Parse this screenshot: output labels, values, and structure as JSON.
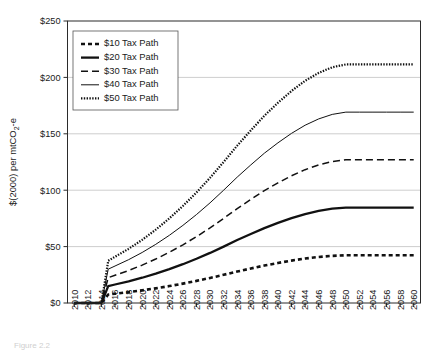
{
  "chart_data": {
    "type": "line",
    "title": "",
    "xlabel": "",
    "ylabel": "$(2000) per mtCO",
    "ylabel_sub": "2",
    "ylabel_tail": "-e",
    "ylabel_full": "$(2000) per mtCO2-e",
    "grid": true,
    "legend_position": "top-left-inside",
    "xlim": [
      2009,
      2061
    ],
    "ylim": [
      0,
      250
    ],
    "ytick_labels": [
      "$0",
      "$50",
      "$100",
      "$150",
      "$200",
      "$250"
    ],
    "ytick_values": [
      0,
      50,
      100,
      150,
      200,
      250
    ],
    "xtick_labels": [
      "2010",
      "2012",
      "2014",
      "2016",
      "2018",
      "2020",
      "2022",
      "2024",
      "2026",
      "2028",
      "2030",
      "2032",
      "2034",
      "2036",
      "2038",
      "2040",
      "2042",
      "2044",
      "2046",
      "2048",
      "2050",
      "2052",
      "2054",
      "2056",
      "2058",
      "2060"
    ],
    "x": [
      2010,
      2011,
      2012,
      2013,
      2014,
      2015,
      2016,
      2018,
      2020,
      2022,
      2024,
      2026,
      2028,
      2030,
      2032,
      2034,
      2036,
      2038,
      2040,
      2042,
      2044,
      2046,
      2048,
      2050,
      2052,
      2054,
      2056,
      2058,
      2060
    ],
    "series": [
      {
        "name": "$10 Tax Path",
        "dash": "4,3",
        "width": 2.6,
        "values": [
          0,
          0,
          0,
          0,
          0,
          7.5,
          8.2,
          9.6,
          11.2,
          13.0,
          15.0,
          17.2,
          19.6,
          22.2,
          25.0,
          27.9,
          30.6,
          33.2,
          35.5,
          37.6,
          39.4,
          40.8,
          41.8,
          42.3,
          42.3,
          42.3,
          42.3,
          42.3,
          42.3
        ]
      },
      {
        "name": "$20 Tax Path",
        "dash": "none",
        "width": 2.3,
        "values": [
          0,
          0,
          0,
          0,
          0,
          15.0,
          16.4,
          19.2,
          22.4,
          26.0,
          30.0,
          34.4,
          39.2,
          44.4,
          50.0,
          55.8,
          61.2,
          66.4,
          71.0,
          75.2,
          78.8,
          81.6,
          83.6,
          84.6,
          84.6,
          84.6,
          84.6,
          84.6,
          84.6
        ]
      },
      {
        "name": "$30 Tax Path",
        "dash": "7,4",
        "width": 1.5,
        "values": [
          0,
          0,
          0,
          0,
          0,
          22.5,
          24.6,
          28.8,
          33.6,
          39.0,
          45.0,
          51.6,
          58.8,
          66.6,
          75.0,
          83.7,
          91.8,
          99.6,
          106.5,
          112.8,
          118.2,
          122.4,
          125.4,
          126.9,
          126.9,
          126.9,
          126.9,
          126.9,
          126.9
        ]
      },
      {
        "name": "$40 Tax Path",
        "dash": "none",
        "width": 1.0,
        "values": [
          0,
          0,
          0,
          0,
          0,
          30.0,
          32.8,
          38.4,
          44.8,
          52.0,
          60.0,
          68.8,
          78.4,
          88.8,
          100.0,
          111.6,
          122.4,
          132.8,
          142.0,
          150.4,
          157.6,
          163.2,
          167.2,
          169.2,
          169.2,
          169.2,
          169.2,
          169.2,
          169.2
        ]
      },
      {
        "name": "$50 Tax Path",
        "dash": "1.4,1.4",
        "width": 2.2,
        "values": [
          0,
          0,
          0,
          0,
          0,
          37.5,
          41.0,
          48.0,
          56.0,
          65.0,
          75.0,
          86.0,
          98.0,
          111.0,
          125.0,
          139.5,
          153.0,
          166.0,
          177.5,
          188.0,
          197.0,
          204.0,
          209.0,
          211.5,
          211.5,
          211.5,
          211.5,
          211.5,
          211.5
        ]
      }
    ]
  },
  "legend": {
    "entries": [
      {
        "label": "$10 Tax Path"
      },
      {
        "label": "$20 Tax Path"
      },
      {
        "label": "$30 Tax Path"
      },
      {
        "label": "$40 Tax Path"
      },
      {
        "label": "$50 Tax Path"
      }
    ]
  },
  "caption": {
    "text": "Figure 2.2"
  }
}
